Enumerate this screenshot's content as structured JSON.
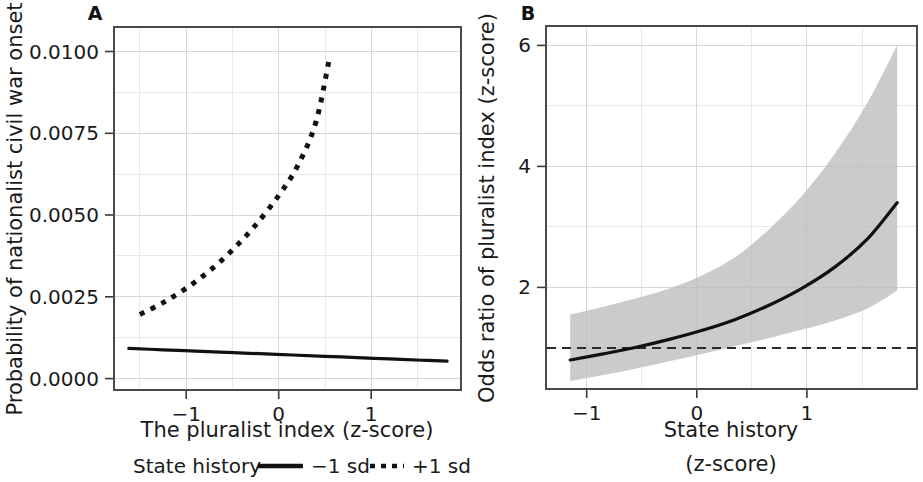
{
  "figure": {
    "background": "#ffffff",
    "line_color": "#111111",
    "ribbon_color": "#bdbdbd",
    "grid_color": "#d8d8d8"
  },
  "panels": [
    {
      "letter": "A",
      "ylabel": "Probability of nationalist civil war onset",
      "xlabel": "The pluralist index (z-score)",
      "yticks": [
        "0.0000",
        "0.0025",
        "0.0050",
        "0.0075",
        "0.0100"
      ],
      "xticks": [
        "−1",
        "0",
        "1"
      ]
    },
    {
      "letter": "B",
      "ylabel": "Odds ratio of pluralist index (z-score)",
      "xlabel_line1": "State history",
      "xlabel_line2": "(z-score)",
      "yticks": [
        "2",
        "4",
        "6"
      ],
      "xticks": [
        "−1",
        "0",
        "1"
      ]
    }
  ],
  "legend": {
    "title": "State history",
    "items": [
      {
        "label": "−1 sd",
        "style": "solid"
      },
      {
        "label": "+1 sd",
        "style": "dotted"
      }
    ]
  },
  "chart_data": [
    {
      "type": "line",
      "panel": "A",
      "title": "A",
      "xlabel": "The pluralist index (z-score)",
      "ylabel": "Probability of nationalist civil war onset",
      "xlim": [
        -1.78,
        1.97
      ],
      "ylim": [
        -0.00035,
        0.01075
      ],
      "xticks": [
        -1,
        0,
        1
      ],
      "yticks": [
        0.0,
        0.0025,
        0.005,
        0.0075,
        0.01
      ],
      "grid": true,
      "legend": "below-axis",
      "series": [
        {
          "name": "−1 sd",
          "style": "solid",
          "x": [
            -1.62,
            -1.25,
            -0.9,
            -0.55,
            -0.2,
            0.15,
            0.5,
            0.85,
            1.2,
            1.55,
            1.82
          ],
          "y": [
            0.00092,
            0.00088,
            0.00084,
            0.0008,
            0.00076,
            0.00072,
            0.00068,
            0.00064,
            0.0006,
            0.00056,
            0.00053
          ]
        },
        {
          "name": "+1 sd",
          "style": "dotted",
          "x": [
            -1.5,
            -1.25,
            -1.0,
            -0.75,
            -0.5,
            -0.25,
            0.0,
            0.2,
            0.4,
            0.55
          ],
          "y": [
            0.00196,
            0.00232,
            0.00276,
            0.00329,
            0.00393,
            0.00469,
            0.0056,
            0.00648,
            0.00782,
            0.00982
          ]
        }
      ]
    },
    {
      "type": "line",
      "panel": "B",
      "title": "B",
      "xlabel": "State history (z-score)",
      "ylabel": "Odds ratio of pluralist index (z-score)",
      "xlim": [
        -1.37,
        2.0
      ],
      "ylim": [
        0.32,
        6.32
      ],
      "xticks": [
        -1,
        0,
        1
      ],
      "yticks": [
        2,
        4,
        6
      ],
      "grid": true,
      "reference_line": {
        "y": 1,
        "style": "dashed"
      },
      "series": [
        {
          "name": "Odds ratio",
          "style": "solid",
          "x": [
            -1.15,
            -0.85,
            -0.55,
            -0.25,
            0.05,
            0.35,
            0.65,
            0.95,
            1.25,
            1.55,
            1.82
          ],
          "y": [
            0.8,
            0.9,
            1.01,
            1.14,
            1.29,
            1.47,
            1.7,
            1.98,
            2.33,
            2.8,
            3.4
          ]
        }
      ],
      "confidence_band": {
        "name": "95% CI",
        "x": [
          -1.15,
          -0.85,
          -0.55,
          -0.25,
          0.05,
          0.35,
          0.65,
          0.95,
          1.25,
          1.55,
          1.82
        ],
        "lower": [
          0.45,
          0.55,
          0.66,
          0.78,
          0.9,
          1.03,
          1.16,
          1.3,
          1.45,
          1.65,
          1.95
        ],
        "upper": [
          1.55,
          1.68,
          1.82,
          1.98,
          2.2,
          2.5,
          2.95,
          3.5,
          4.2,
          5.05,
          6.0
        ]
      }
    }
  ]
}
